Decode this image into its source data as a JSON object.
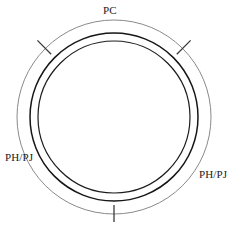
{
  "figure": {
    "type": "technical-drawing",
    "background_color": "#ffffff"
  },
  "labels": {
    "top": "PC",
    "left": "PH/PJ",
    "right": "PH/PJ"
  },
  "geometry": {
    "center": {
      "x": 114,
      "y": 117
    },
    "circles": [
      {
        "name": "outer-circle",
        "radius": 97,
        "color": "#8a8a8a",
        "stroke_width": 1
      },
      {
        "name": "middle-circle",
        "radius": 84,
        "color": "#161616",
        "stroke_width": 1.5
      },
      {
        "name": "inner-circle",
        "radius": 76,
        "color": "#1d1d1d",
        "stroke_width": 1.2
      }
    ],
    "ticks": [
      {
        "name": "tick-upper-left",
        "angle_deg": 135,
        "length": 14,
        "color": "#3a3a3a"
      },
      {
        "name": "tick-upper-right",
        "angle_deg": 45,
        "length": 14,
        "color": "#3a3a3a"
      },
      {
        "name": "tick-bottom",
        "angle_deg": 270,
        "length": 14,
        "color": "#3a3a3a"
      }
    ]
  }
}
